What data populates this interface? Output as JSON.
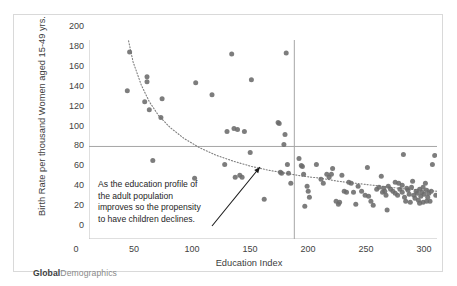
{
  "clipped_title": "",
  "logo": {
    "bold_part": "Global",
    "light_part": "Demographics"
  },
  "annotation": {
    "lines": [
      "As the education profile of",
      "the adult population",
      "improves so the propensity",
      "to have children declines."
    ],
    "arrow": {
      "from": [
        198,
        211
      ],
      "to": [
        246,
        152
      ]
    }
  },
  "colors": {
    "point": "#6b6b6b",
    "axis": "#bfbfbf",
    "reference_line": "#a6a6a6",
    "trendline": "#7f7f7f",
    "border": "#d9d9d9",
    "text": "#3f3f3f"
  },
  "chart_data": {
    "type": "scatter",
    "title": "",
    "xlabel": "Education Index",
    "ylabel": "Birth Rate per thousand Women aged 15-49 yrs.",
    "xlim": [
      0,
      300
    ],
    "ylim": [
      0,
      200
    ],
    "xticks": [
      0,
      50,
      100,
      150,
      200,
      250,
      300
    ],
    "yticks": [
      0,
      20,
      40,
      60,
      80,
      100,
      120,
      140,
      160,
      180,
      200
    ],
    "grid": false,
    "legend": null,
    "reference_lines": [
      {
        "orientation": "horizontal",
        "value": 93
      },
      {
        "orientation": "vertical",
        "value": 177
      }
    ],
    "trendline": {
      "kind": "power-decay",
      "note": "dotted decreasing curve",
      "points": [
        [
          33,
          205
        ],
        [
          38,
          178
        ],
        [
          45,
          155
        ],
        [
          52,
          138
        ],
        [
          60,
          124
        ],
        [
          70,
          112
        ],
        [
          82,
          101
        ],
        [
          95,
          92
        ],
        [
          110,
          84
        ],
        [
          125,
          78
        ],
        [
          140,
          73
        ],
        [
          155,
          69
        ],
        [
          170,
          66
        ],
        [
          185,
          63
        ],
        [
          200,
          61
        ],
        [
          215,
          58
        ],
        [
          230,
          56
        ],
        [
          245,
          54
        ],
        [
          260,
          52
        ],
        [
          275,
          50
        ],
        [
          290,
          49
        ],
        [
          300,
          48
        ]
      ]
    },
    "series": [
      {
        "name": "Countries",
        "points": [
          [
            33,
            149
          ],
          [
            35,
            188
          ],
          [
            48,
            138
          ],
          [
            50,
            163
          ],
          [
            50,
            158
          ],
          [
            52,
            130
          ],
          [
            55,
            79
          ],
          [
            62,
            122
          ],
          [
            63,
            141
          ],
          [
            91,
            61
          ],
          [
            92,
            157
          ],
          [
            106,
            145
          ],
          [
            117,
            75
          ],
          [
            119,
            108
          ],
          [
            123,
            186
          ],
          [
            125,
            111
          ],
          [
            126,
            62
          ],
          [
            128,
            110
          ],
          [
            130,
            64
          ],
          [
            132,
            62
          ],
          [
            134,
            108
          ],
          [
            139,
            87
          ],
          [
            140,
            160
          ],
          [
            151,
            40
          ],
          [
            163,
            117
          ],
          [
            164,
            116
          ],
          [
            165,
            67
          ],
          [
            166,
            66
          ],
          [
            168,
            95
          ],
          [
            169,
            105
          ],
          [
            170,
            187
          ],
          [
            171,
            75
          ],
          [
            172,
            66
          ],
          [
            174,
            56
          ],
          [
            181,
            81
          ],
          [
            183,
            74
          ],
          [
            184,
            73
          ],
          [
            185,
            65
          ],
          [
            186,
            33
          ],
          [
            188,
            53
          ],
          [
            189,
            48
          ],
          [
            190,
            42
          ],
          [
            196,
            75
          ],
          [
            200,
            60
          ],
          [
            202,
            56
          ],
          [
            205,
            65
          ],
          [
            207,
            62
          ],
          [
            209,
            65
          ],
          [
            210,
            71
          ],
          [
            213,
            38
          ],
          [
            215,
            35
          ],
          [
            216,
            37
          ],
          [
            218,
            64
          ],
          [
            220,
            48
          ],
          [
            222,
            47
          ],
          [
            224,
            57
          ],
          [
            226,
            56
          ],
          [
            228,
            47
          ],
          [
            230,
            35
          ],
          [
            232,
            53
          ],
          [
            235,
            48
          ],
          [
            238,
            44
          ],
          [
            240,
            72
          ],
          [
            241,
            43
          ],
          [
            243,
            38
          ],
          [
            245,
            34
          ],
          [
            248,
            50
          ],
          [
            250,
            52
          ],
          [
            252,
            63
          ],
          [
            253,
            47
          ],
          [
            254,
            51
          ],
          [
            255,
            48
          ],
          [
            256,
            44
          ],
          [
            257,
            29
          ],
          [
            258,
            53
          ],
          [
            260,
            50
          ],
          [
            262,
            48
          ],
          [
            264,
            46
          ],
          [
            266,
            44
          ],
          [
            268,
            50
          ],
          [
            270,
            47
          ],
          [
            271,
            85
          ],
          [
            272,
            42
          ],
          [
            273,
            38
          ],
          [
            274,
            51
          ],
          [
            275,
            49
          ],
          [
            276,
            45
          ],
          [
            277,
            37
          ],
          [
            278,
            52
          ],
          [
            279,
            58
          ],
          [
            280,
            44
          ],
          [
            281,
            41
          ],
          [
            282,
            48
          ],
          [
            283,
            46
          ],
          [
            284,
            39
          ],
          [
            285,
            50
          ],
          [
            286,
            43
          ],
          [
            287,
            47
          ],
          [
            288,
            37
          ],
          [
            289,
            45
          ],
          [
            290,
            56
          ],
          [
            291,
            49
          ],
          [
            292,
            42
          ],
          [
            293,
            46
          ],
          [
            294,
            38
          ],
          [
            295,
            48
          ],
          [
            296,
            75
          ],
          [
            298,
            84
          ],
          [
            299,
            44
          ],
          [
            264,
            57
          ],
          [
            267,
            56
          ],
          [
            270,
            54
          ],
          [
            285,
            36
          ],
          [
            288,
            52
          ],
          [
            291,
            38
          ]
        ]
      }
    ]
  }
}
